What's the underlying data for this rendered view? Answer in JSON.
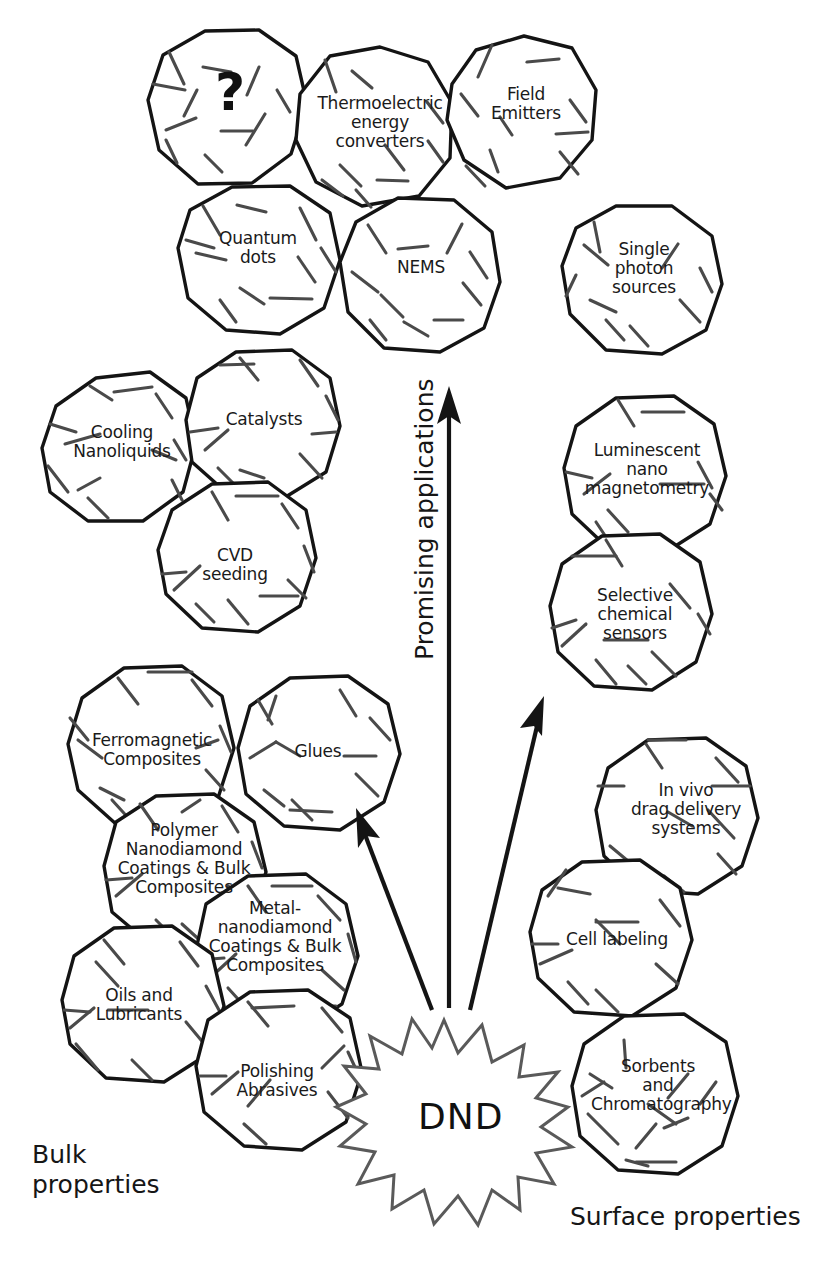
{
  "figure": {
    "center_label": "DND",
    "axis_label_vertical": "Promising\napplications",
    "corner_left": "Bulk\nproperties",
    "corner_right": "Surface properties",
    "unknown_marker": "?"
  },
  "colors": {
    "ink": "#141414",
    "facet": "#4a4a4a",
    "star": "#5a5a5a",
    "background": "#ffffff"
  },
  "nodes": [
    {
      "id": "unknown",
      "label": "?",
      "group": "promising"
    },
    {
      "id": "thermoelectric",
      "label": "Thermoelectric\nenergy\nconverters",
      "group": "promising"
    },
    {
      "id": "field-emitters",
      "label": "Field\nEmitters",
      "group": "promising"
    },
    {
      "id": "quantum-dots",
      "label": "Quantum\ndots",
      "group": "promising"
    },
    {
      "id": "nems",
      "label": "NEMS",
      "group": "promising"
    },
    {
      "id": "single-photon",
      "label": "Single\nphoton\nsources",
      "group": "promising"
    },
    {
      "id": "cooling-nanoliquids",
      "label": "Cooling\nNanoliquids",
      "group": "bulk"
    },
    {
      "id": "catalysts",
      "label": "Catalysts",
      "group": "bulk"
    },
    {
      "id": "cvd-seeding",
      "label": "CVD\nseeding",
      "group": "bulk"
    },
    {
      "id": "ferromagnetic",
      "label": "Ferromagnetic\nComposites",
      "group": "bulk"
    },
    {
      "id": "glues",
      "label": "Glues",
      "group": "bulk"
    },
    {
      "id": "polymer-nd",
      "label": "Polymer\nNanodiamond\nCoatings & Bulk\nComposites",
      "group": "bulk"
    },
    {
      "id": "metal-nd",
      "label": "Metal-\nnanodiamond\nCoatings & Bulk\nComposites",
      "group": "bulk"
    },
    {
      "id": "oils-lubricants",
      "label": "Oils and\nLubricants",
      "group": "bulk"
    },
    {
      "id": "polishing",
      "label": "Polishing\nAbrasives",
      "group": "bulk"
    },
    {
      "id": "luminescent",
      "label": "Luminescent\nnano\nmagnetometry",
      "group": "surface"
    },
    {
      "id": "chem-sensors",
      "label": "Selective\nchemical\nsensors",
      "group": "surface"
    },
    {
      "id": "drug-delivery",
      "label": "In vivo\ndrag delivery\nsystems",
      "group": "surface"
    },
    {
      "id": "cell-labeling",
      "label": "Cell labeling",
      "group": "surface"
    },
    {
      "id": "sorbents",
      "label": "Sorbents\nand\nChromatography",
      "group": "surface"
    }
  ],
  "arrows": [
    {
      "id": "arrow-bulk",
      "direction": "up-left"
    },
    {
      "id": "arrow-promising",
      "direction": "up"
    },
    {
      "id": "arrow-surface",
      "direction": "up-right"
    }
  ]
}
